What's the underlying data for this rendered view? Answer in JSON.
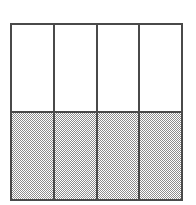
{
  "figure": {
    "type": "area-model-grid",
    "columns": 4,
    "rows": 2,
    "total_cells": 8,
    "shaded_cells": 4,
    "unshaded_cells": 4,
    "shaded_fraction": "4/8",
    "colors": {
      "outline": "#4a4a4a",
      "unshaded_fill": "#ffffff",
      "shaded_fill": "#8d8d8d",
      "page_background": "#ffffff"
    },
    "cells": [
      {
        "column": 1,
        "row": 1,
        "state": "unshaded"
      },
      {
        "column": 1,
        "row": 2,
        "state": "shaded"
      },
      {
        "column": 2,
        "row": 1,
        "state": "unshaded"
      },
      {
        "column": 2,
        "row": 2,
        "state": "shaded"
      },
      {
        "column": 3,
        "row": 1,
        "state": "unshaded"
      },
      {
        "column": 3,
        "row": 2,
        "state": "shaded"
      },
      {
        "column": 4,
        "row": 1,
        "state": "unshaded"
      },
      {
        "column": 4,
        "row": 2,
        "state": "shaded"
      }
    ],
    "caption": ""
  },
  "chart_data": {
    "type": "bar",
    "title": "",
    "subtitle": "",
    "xlabel": "",
    "ylabel": "",
    "categories": [
      "1",
      "2",
      "3",
      "4"
    ],
    "values": [
      0.5,
      0.5,
      0.5,
      0.5
    ],
    "ylim": [
      0,
      1
    ],
    "grid": false,
    "legend": [],
    "legend_position": "none",
    "tick_labels_x": [],
    "tick_labels_y": [],
    "annotations": []
  }
}
